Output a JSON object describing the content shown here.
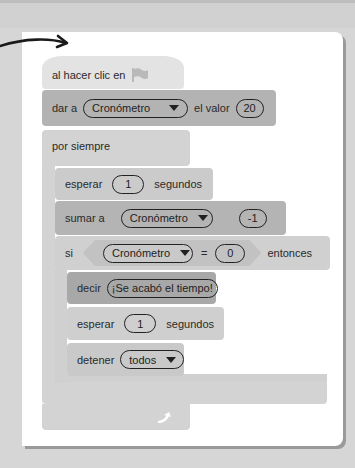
{
  "script": {
    "hat_block": {
      "label": "al hacer clic en",
      "icon": "green-flag-icon"
    },
    "set_block": {
      "label": "dar a",
      "variable": "Cronómetro",
      "to_label": "el valor",
      "value": "20"
    },
    "forever_block": {
      "label": "por siempre",
      "footer_icon": "loop-arrow-icon"
    },
    "wait_block_1": {
      "label": "esperar",
      "value": "1",
      "unit": "segundos"
    },
    "change_block": {
      "label": "sumar a",
      "variable": "Cronómetro",
      "value": "-1"
    },
    "if_block": {
      "label": "si",
      "variable": "Cronómetro",
      "operator": "=",
      "compare_value": "0",
      "then_label": "entonces"
    },
    "say_block": {
      "label": "decir",
      "message": "¡Se acabó el tiempo!"
    },
    "wait_block_2": {
      "label": "esperar",
      "value": "1",
      "unit": "segundos"
    },
    "stop_block": {
      "label": "detener",
      "option": "todos"
    }
  },
  "colors": {
    "background": "#d6d6d6",
    "card": "#ffffff",
    "hat_block": "#e3e3e3",
    "set_block": "#b3b3b3",
    "say_block": "#a8a8a8"
  }
}
